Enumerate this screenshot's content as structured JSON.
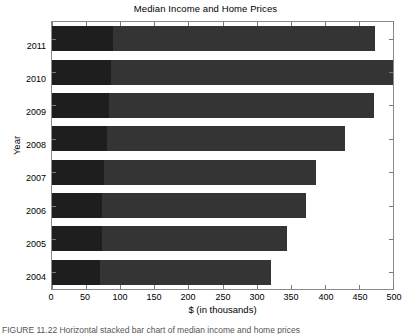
{
  "chart_data": {
    "type": "bar",
    "orientation": "horizontal",
    "stacked": true,
    "title": "Median Income and Home Prices",
    "xlabel": "$ (in thousands)",
    "ylabel": "Year",
    "categories": [
      "2011",
      "2010",
      "2009",
      "2008",
      "2007",
      "2006",
      "2005",
      "2004"
    ],
    "series": [
      {
        "name": "Median Income",
        "values": [
          90,
          87,
          83,
          80,
          76,
          74,
          74,
          71
        ],
        "color": "#1e1e1e"
      },
      {
        "name": "Median Home Price",
        "values": [
          383,
          413,
          389,
          350,
          311,
          299,
          270,
          250
        ],
        "color": "#343434"
      }
    ],
    "totals": [
      473,
      500,
      472,
      430,
      387,
      373,
      344,
      321
    ],
    "xlim": [
      0,
      500
    ],
    "xticks": [
      0,
      50,
      100,
      150,
      200,
      250,
      300,
      350,
      400,
      450,
      500
    ],
    "xticklabels": [
      "0",
      "50",
      "100",
      "150",
      "200",
      "250",
      "300",
      "350",
      "400",
      "450",
      "500"
    ],
    "grid": false,
    "legend": null,
    "tick_direction": "in",
    "box": true
  },
  "figure": {
    "title": "Median Income and Home Prices",
    "x_axis_title": "$ (in thousands)",
    "y_axis_title": "Year"
  },
  "caption": {
    "text": "FIGURE 11.22  Horizontal stacked bar chart of median income and home prices"
  }
}
